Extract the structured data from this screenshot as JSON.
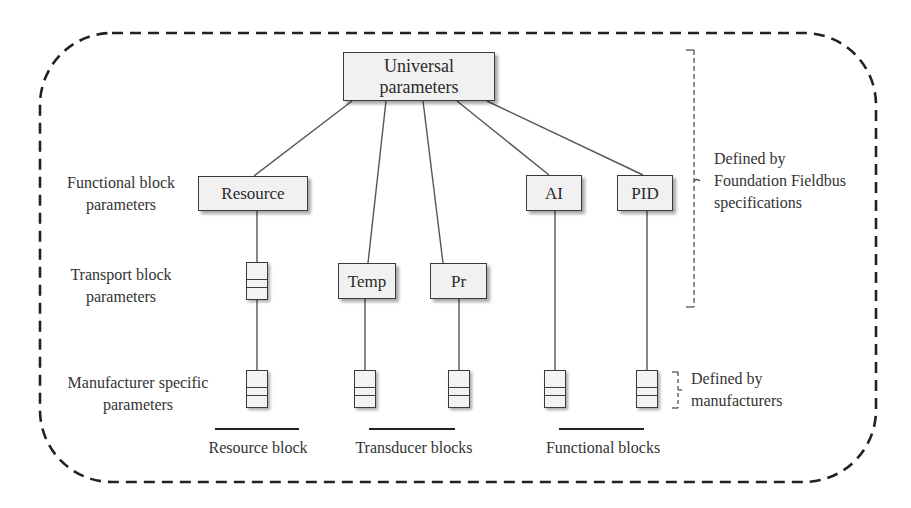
{
  "diagram": {
    "root": {
      "label_line1": "Universal",
      "label_line2": "parameters"
    },
    "function_blocks": [
      {
        "id": "resource",
        "label": "Resource"
      },
      {
        "id": "ai",
        "label": "AI"
      },
      {
        "id": "pid",
        "label": "PID"
      }
    ],
    "transducer_blocks": [
      {
        "id": "temp",
        "label": "Temp"
      },
      {
        "id": "pr",
        "label": "Pr"
      }
    ],
    "row_labels": {
      "functional": {
        "line1": "Functional block",
        "line2": "parameters"
      },
      "transport": {
        "line1": "Transport block",
        "line2": "parameters"
      },
      "manufacturer": {
        "line1": "Manufacturer specific",
        "line2": "parameters"
      }
    },
    "annotations": {
      "foundation": {
        "line1": "Defined by",
        "line2": "Foundation Fieldbus",
        "line3": "specifications"
      },
      "manufacturers": {
        "line1": "Defined by",
        "line2": "manufacturers"
      }
    },
    "group_captions": {
      "resource": "Resource block",
      "transducer": "Transducer blocks",
      "functional": "Functional blocks"
    },
    "icons": {
      "parameter_stack": "stacked-parameter-icon",
      "brace": "dashed-brace"
    },
    "colors": {
      "box_fill": "#f1f1f1",
      "stroke": "#3a3a3a",
      "border_dash": "#222222",
      "text": "#2a2a2a"
    }
  }
}
